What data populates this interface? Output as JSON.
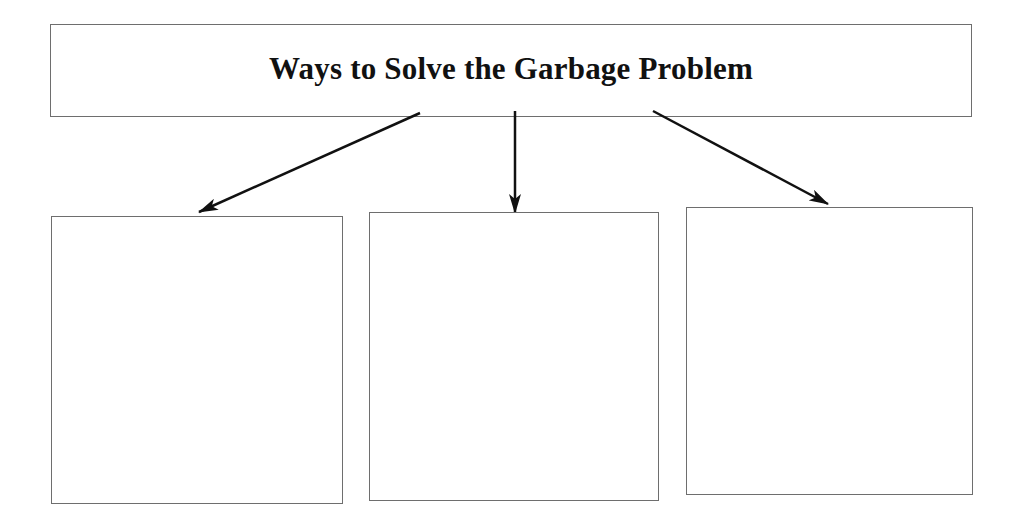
{
  "diagram": {
    "title": "Ways to Solve the Garbage Problem",
    "colors": {
      "border": "#6e6e6e",
      "arrow": "#111111",
      "background": "#ffffff"
    },
    "boxes": [
      {
        "id": "solution-1",
        "text": ""
      },
      {
        "id": "solution-2",
        "text": ""
      },
      {
        "id": "solution-3",
        "text": ""
      }
    ]
  }
}
